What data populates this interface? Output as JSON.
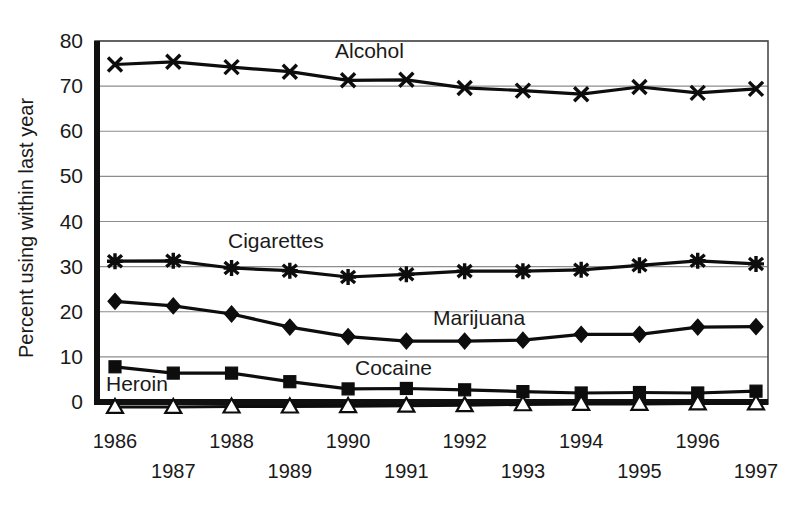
{
  "chart_data": {
    "type": "line",
    "title": "",
    "xlabel": "",
    "ylabel": "Percent using within last year",
    "ylim": [
      0,
      80
    ],
    "ytick_values": [
      0,
      10,
      20,
      30,
      40,
      50,
      60,
      70,
      80
    ],
    "ytick_labels": [
      "0",
      "10",
      "20",
      "30",
      "40",
      "50",
      "60",
      "70",
      "80"
    ],
    "grid": "horizontal",
    "legend_position": "inline-annotations",
    "categories": [
      "1986",
      "1987",
      "1988",
      "1989",
      "1990",
      "1991",
      "1992",
      "1993",
      "1994",
      "1995",
      "1996",
      "1997"
    ],
    "x": [
      1986,
      1987,
      1988,
      1989,
      1990,
      1991,
      1992,
      1993,
      1994,
      1995,
      1996,
      1997
    ],
    "series": [
      {
        "name": "Alcohol",
        "marker": "x-cross",
        "values": [
          74.8,
          75.4,
          74.2,
          73.2,
          71.3,
          71.4,
          69.6,
          69.0,
          68.2,
          69.8,
          68.5,
          69.4
        ]
      },
      {
        "name": "Cigarettes",
        "marker": "asterisk",
        "values": [
          31.2,
          31.3,
          29.7,
          29.1,
          27.7,
          28.3,
          29.0,
          29.0,
          29.3,
          30.3,
          31.3,
          30.6
        ]
      },
      {
        "name": "Marijuana",
        "marker": "diamond",
        "values": [
          22.3,
          21.3,
          19.5,
          16.6,
          14.5,
          13.5,
          13.5,
          13.7,
          15.0,
          15.0,
          16.6,
          16.7
        ]
      },
      {
        "name": "Cocaine",
        "marker": "square",
        "values": [
          7.8,
          6.4,
          6.4,
          4.5,
          2.9,
          3.0,
          2.7,
          2.3,
          2.0,
          2.1,
          2.0,
          2.4
        ]
      },
      {
        "name": "Heroin",
        "marker": "triangle-open",
        "values": [
          -1.1,
          -1.1,
          -1.0,
          -1.0,
          -0.9,
          -0.8,
          -0.7,
          -0.5,
          -0.4,
          -0.4,
          -0.3,
          -0.3
        ]
      }
    ],
    "annotations": [
      {
        "text": "Alcohol",
        "x_px": 335,
        "y_px": 58
      },
      {
        "text": "Cigarettes",
        "x_px": 228,
        "y_px": 248
      },
      {
        "text": "Marijuana",
        "x_px": 433,
        "y_px": 325
      },
      {
        "text": "Cocaine",
        "x_px": 355,
        "y_px": 375
      },
      {
        "text": "Heroin",
        "x_px": 106,
        "y_px": 391
      }
    ],
    "x_tick_label_rows": [
      {
        "row": "top",
        "labels": [
          "1986",
          "1988",
          "1990",
          "1992",
          "1994",
          "1996"
        ]
      },
      {
        "row": "bottom",
        "labels": [
          "1987",
          "1989",
          "1991",
          "1993",
          "1995",
          "1997"
        ]
      }
    ]
  },
  "colors": {
    "ink": "#0d0d0d",
    "gridline": "#8d8d8d",
    "frame": "#4a4a4a",
    "background": "#ffffff"
  }
}
